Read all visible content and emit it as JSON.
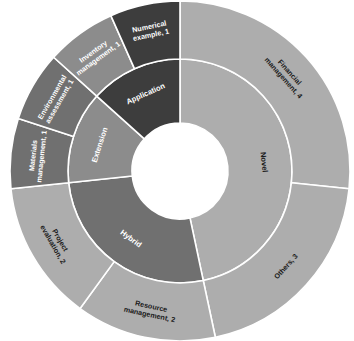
{
  "chart_data": {
    "type": "pie",
    "variant": "sunburst-donut",
    "title": "",
    "subtitle": "",
    "xlabel": "",
    "ylabel": "",
    "legend": false,
    "legend_position": "none",
    "grid": false,
    "total": 15,
    "units_per_degree": 24,
    "rings": [
      {
        "name": "inner",
        "level": 1,
        "categories": [
          "Novel",
          "Resource management",
          "Project evaluation",
          "Hybrid",
          "Extension",
          "Application"
        ],
        "slices": [
          {
            "label": "Novel",
            "value": 7,
            "color": "#ADADAD",
            "text_color": "#1a1a1a",
            "start_deg": 0,
            "end_deg": 168
          },
          {
            "label": "Hybrid",
            "value": 4,
            "color": "#707070",
            "text_color": "#ffffff",
            "start_deg": 168,
            "end_deg": 264
          },
          {
            "label": "Extension",
            "value": 2,
            "color": "#8C8C8C",
            "text_color": "#ffffff",
            "start_deg": 264,
            "end_deg": 312
          },
          {
            "label": "Application",
            "value": 2,
            "color": "#3D3D3D",
            "text_color": "#ffffff",
            "start_deg": 312,
            "end_deg": 360
          }
        ]
      },
      {
        "name": "outer",
        "level": 2,
        "categories": [
          "Financial management",
          "Others",
          "Resource management",
          "Project evaluation",
          "Materials management",
          "Environmental assessment",
          "Inventory management",
          "Numerical example"
        ],
        "values": [
          4,
          3,
          2,
          2,
          1,
          1,
          1,
          1
        ],
        "slices": [
          {
            "label": "Financial management, 4",
            "name": "Financial management",
            "value": 4,
            "color": "#ADADAD",
            "text_color": "#1a1a1a",
            "start_deg": 0,
            "end_deg": 96
          },
          {
            "label": "Others, 3",
            "name": "Others",
            "value": 3,
            "color": "#ADADAD",
            "text_color": "#1a1a1a",
            "start_deg": 96,
            "end_deg": 168
          },
          {
            "label": "Resource management, 2",
            "name": "Resource management",
            "value": 2,
            "color": "#ADADAD",
            "text_color": "#1a1a1a",
            "start_deg": 168,
            "end_deg": 216
          },
          {
            "label": "Project evaluation, 2",
            "name": "Project evaluation",
            "value": 2,
            "color": "#ADADAD",
            "text_color": "#1a1a1a",
            "start_deg": 216,
            "end_deg": 264
          },
          {
            "label": "Materials management, 1",
            "name": "Materials management",
            "value": 1,
            "color": "#707070",
            "text_color": "#ffffff",
            "start_deg": 264,
            "end_deg": 288
          },
          {
            "label": "Environmental assessment, 1",
            "name": "Environmental assessment",
            "value": 1,
            "color": "#707070",
            "text_color": "#ffffff",
            "start_deg": 288,
            "end_deg": 312
          },
          {
            "label": "Inventory management, 1",
            "name": "Inventory management",
            "value": 1,
            "color": "#8C8C8C",
            "text_color": "#ffffff",
            "start_deg": 312,
            "end_deg": 336
          },
          {
            "label": "Numerical example, 1",
            "name": "Numerical example",
            "value": 1,
            "color": "#3D3D3D",
            "text_color": "#ffffff",
            "start_deg": 336,
            "end_deg": 360
          }
        ]
      }
    ],
    "geometry": {
      "cx": 180,
      "cy": 171,
      "hole_radius": 48,
      "inner_ring_outer_radius": 112,
      "outer_ring_outer_radius": 170
    },
    "colors": {
      "light_gray": "#ADADAD",
      "medium_gray": "#8C8C8C",
      "dark_medium_gray": "#707070",
      "darkest_gray": "#3D3D3D",
      "separator": "#ffffff",
      "background": "#ffffff",
      "label_dark": "#1a1a1a",
      "label_light": "#ffffff"
    }
  }
}
